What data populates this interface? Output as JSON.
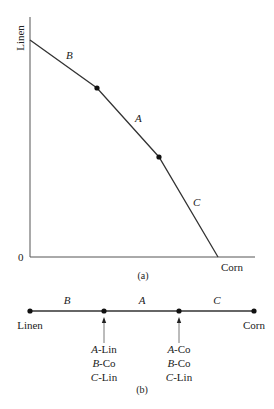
{
  "panel_a": {
    "y_axis_label": "Linen",
    "x_axis_label": "Corn",
    "origin_label": "0",
    "caption": "(a)",
    "segments": [
      {
        "label": "B"
      },
      {
        "label": "A"
      },
      {
        "label": "C"
      }
    ]
  },
  "panel_b": {
    "left_label": "Linen",
    "right_label": "Corn",
    "caption": "(b)",
    "segments": [
      {
        "label": "B"
      },
      {
        "label": "A"
      },
      {
        "label": "C"
      }
    ],
    "kinks": [
      {
        "lines": [
          {
            "country": "A",
            "good": "-Lin"
          },
          {
            "country": "B",
            "good": "-Co"
          },
          {
            "country": "C",
            "good": "-Lin"
          }
        ]
      },
      {
        "lines": [
          {
            "country": "A",
            "good": "-Co"
          },
          {
            "country": "B",
            "good": "-Co"
          },
          {
            "country": "C",
            "good": "-Lin"
          }
        ]
      }
    ]
  },
  "colors": {
    "line": "#333333",
    "text": "#222222"
  }
}
